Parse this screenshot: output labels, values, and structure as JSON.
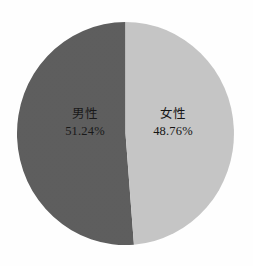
{
  "chart_data": {
    "type": "pie",
    "title": "",
    "subtitle": "",
    "xlabel": "",
    "ylabel": "",
    "legend_position": "none",
    "grid": false,
    "labels_inside_slices": true,
    "start_angle_deg": 0,
    "direction": "counterclockwise",
    "categories": [
      "男性",
      "女性"
    ],
    "values": [
      51.24,
      48.76
    ],
    "value_unit": "%",
    "slices": [
      {
        "label": "男性",
        "value": 51.24,
        "display_value": "51.24%",
        "color": "#585858",
        "side": "left"
      },
      {
        "label": "女性",
        "value": 48.76,
        "display_value": "48.76%",
        "color": "#c3c3c3",
        "side": "right"
      }
    ]
  },
  "figure": {
    "background_color": "#fefefe",
    "text_color": "#111111"
  }
}
